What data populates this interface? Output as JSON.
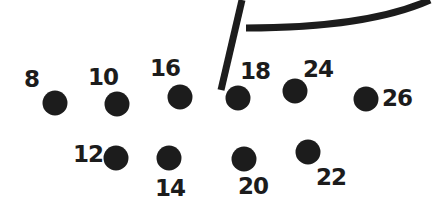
{
  "puzzle": {
    "type": "connect-the-dots",
    "ink_color": "#1c1c1c",
    "background": "#ffffff",
    "dots": [
      {
        "label": "8",
        "cx": 55,
        "cy": 103,
        "lx": 24,
        "ly": 68
      },
      {
        "label": "10",
        "cx": 117,
        "cy": 104,
        "lx": 88,
        "ly": 66
      },
      {
        "label": "16",
        "cx": 180,
        "cy": 97,
        "lx": 150,
        "ly": 57
      },
      {
        "label": "18",
        "cx": 238,
        "cy": 98,
        "lx": 240,
        "ly": 60
      },
      {
        "label": "24",
        "cx": 295,
        "cy": 91,
        "lx": 303,
        "ly": 58
      },
      {
        "label": "26",
        "cx": 366,
        "cy": 99,
        "lx": 382,
        "ly": 87
      },
      {
        "label": "12",
        "cx": 116,
        "cy": 158,
        "lx": 73,
        "ly": 143
      },
      {
        "label": "14",
        "cx": 169,
        "cy": 158,
        "lx": 155,
        "ly": 177
      },
      {
        "label": "20",
        "cx": 244,
        "cy": 159,
        "lx": 238,
        "ly": 175
      },
      {
        "label": "22",
        "cx": 308,
        "cy": 152,
        "lx": 316,
        "ly": 166
      }
    ]
  }
}
